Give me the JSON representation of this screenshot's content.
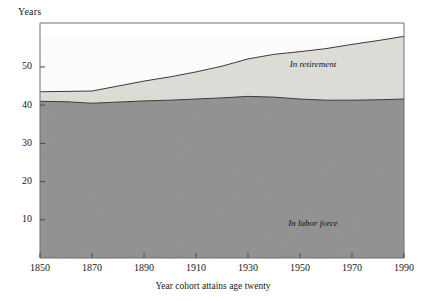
{
  "chart_data": {
    "type": "area",
    "title": "",
    "subtitle": "",
    "xlabel": "Year cohort attains age twenty",
    "ylabel": "Years",
    "xlim": [
      1850,
      1990
    ],
    "ylim": [
      0,
      61.5
    ],
    "grid": false,
    "legend_position": "inline-annotations",
    "stacked": true,
    "xticks": [
      1850,
      1870,
      1890,
      1910,
      1930,
      1950,
      1970,
      1990
    ],
    "xtick_labels": [
      "1850",
      "1870",
      "1890",
      "1910",
      "1930",
      "1950",
      "1970",
      "1990"
    ],
    "yticks": [
      10,
      20,
      30,
      40,
      50
    ],
    "ytick_labels": [
      "10",
      "20",
      "30",
      "40",
      "50"
    ],
    "x": [
      1850,
      1860,
      1870,
      1880,
      1890,
      1900,
      1910,
      1920,
      1930,
      1940,
      1950,
      1960,
      1970,
      1980,
      1990
    ],
    "series": [
      {
        "name": "In labor force",
        "label": "In labor force",
        "color": "#8d8d8d",
        "values": [
          41.0,
          40.9,
          40.5,
          40.8,
          41.1,
          41.3,
          41.6,
          41.9,
          42.3,
          42.1,
          41.6,
          41.3,
          41.3,
          41.4,
          41.6
        ]
      },
      {
        "name": "In retirement",
        "label": "In retirement",
        "color": "#dedcd6",
        "values": [
          2.5,
          2.7,
          3.2,
          4.2,
          5.2,
          6.1,
          7.1,
          8.3,
          9.8,
          11.2,
          12.4,
          13.5,
          14.6,
          15.5,
          16.4
        ]
      }
    ],
    "totals": [
      43.5,
      43.6,
      43.7,
      45.0,
      46.3,
      47.4,
      48.7,
      50.2,
      52.1,
      53.3,
      54.0,
      54.8,
      55.9,
      56.9,
      58.0
    ],
    "annotations": [
      {
        "text": "In retirement",
        "x": 1955,
        "y": 50.0,
        "style": "italic"
      },
      {
        "text": "In labor force",
        "x": 1955,
        "y": 8.5,
        "style": "italic"
      }
    ]
  },
  "axis": {
    "y_axis_title": "Years",
    "x_axis_title": "Year cohort attains age twenty"
  },
  "colors": {
    "labor_force": "#8d8d8d",
    "retirement": "#dedcd6",
    "axis": "#4a4a4a",
    "outline": "#3c3c3c",
    "background": "#ffffff"
  }
}
